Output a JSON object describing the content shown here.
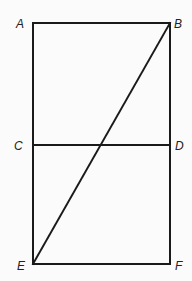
{
  "diagram": {
    "stroke_color": "#1a1a1a",
    "background": "#fbfbfb",
    "points": {
      "A": {
        "label": "A",
        "x": 33,
        "y": 23
      },
      "B": {
        "label": "B",
        "x": 170,
        "y": 23
      },
      "C": {
        "label": "C",
        "x": 33,
        "y": 145
      },
      "D": {
        "label": "D",
        "x": 170,
        "y": 145
      },
      "E": {
        "label": "E",
        "x": 33,
        "y": 264
      },
      "F": {
        "label": "F",
        "x": 170,
        "y": 264
      }
    },
    "segments": [
      "AB",
      "AE",
      "BF",
      "EF",
      "CD",
      "EB"
    ]
  }
}
